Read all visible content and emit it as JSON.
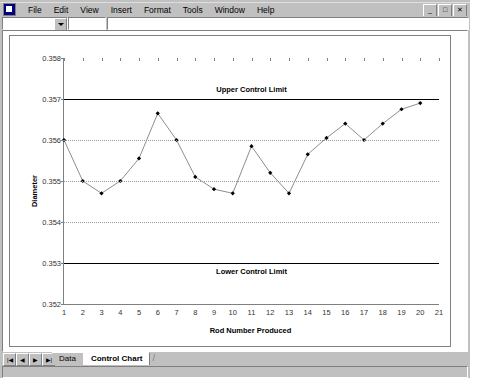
{
  "window": {
    "app_icon": "excel-app-icon",
    "menus": [
      "File",
      "Edit",
      "View",
      "Insert",
      "Format",
      "Tools",
      "Window",
      "Help"
    ],
    "buttons": {
      "minimize": "_",
      "restore": "□",
      "close": "✕"
    },
    "name_box_value": "",
    "formula_value": ""
  },
  "sheet_tabs": {
    "nav_first": "⏮",
    "nav_prev": "◀",
    "nav_next": "▶",
    "nav_last": "⏭",
    "tabs": [
      {
        "label": "Data",
        "active": false
      },
      {
        "label": "Control Chart",
        "active": true
      }
    ]
  },
  "chart_data": {
    "type": "line",
    "title": "",
    "xlabel": "Rod Number Produced",
    "ylabel": "Diameter",
    "xlim": [
      1,
      21
    ],
    "ylim": [
      0.352,
      0.358
    ],
    "grid": true,
    "legend": "none",
    "xticks": [
      1,
      2,
      3,
      4,
      5,
      6,
      7,
      8,
      9,
      10,
      11,
      12,
      13,
      14,
      15,
      16,
      17,
      18,
      19,
      20,
      21
    ],
    "yticks": [
      "0.358",
      "0.357",
      "0.356",
      "0.355",
      "0.354",
      "0.353",
      "0.352"
    ],
    "ytick_values": [
      0.358,
      0.357,
      0.356,
      0.355,
      0.354,
      0.353,
      0.352
    ],
    "gridline_values": [
      0.356,
      0.355,
      0.354
    ],
    "series": [
      {
        "name": "Diameter",
        "marker": "diamond",
        "x": [
          1,
          2,
          3,
          4,
          5,
          6,
          7,
          8,
          9,
          10,
          11,
          12,
          13,
          14,
          15,
          16,
          17,
          18,
          19,
          20
        ],
        "values": [
          0.356,
          0.355,
          0.3547,
          0.355,
          0.35555,
          0.35665,
          0.356,
          0.3551,
          0.3548,
          0.3547,
          0.35585,
          0.3552,
          0.3547,
          0.35565,
          0.35605,
          0.3564,
          0.356,
          0.3564,
          0.35675,
          0.3569
        ]
      }
    ],
    "control_limits": [
      {
        "name": "Upper Control Limit",
        "value": 0.357,
        "label_x": 11
      },
      {
        "name": "Lower Control Limit",
        "value": 0.353,
        "label_x": 11
      }
    ],
    "colors": {
      "line": "#808080",
      "marker": "#000000",
      "control_limit": "#000000",
      "grid": "#9a9a9a",
      "plot_background": "#ffffff"
    }
  }
}
